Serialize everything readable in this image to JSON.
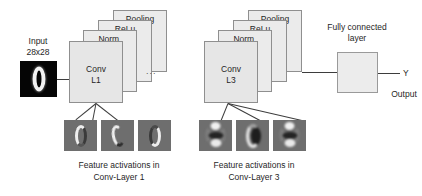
{
  "figure": {
    "type": "cnn-architecture-diagram",
    "title": "",
    "background_color": "#ffffff",
    "plate_fill": "#ebebeb",
    "plate_stroke": "#8f8f8f",
    "line_color": "#3d3d3d",
    "thumb_background": "#6e6e6e",
    "input_background": "#050505"
  },
  "input": {
    "label_line1": "Input",
    "label_line2": "28x28",
    "thumbnail_alt": "handwritten-digit-zero"
  },
  "blocks": [
    {
      "id": "conv-l1",
      "plates": [
        {
          "name": "pooling",
          "label": "Pooling"
        },
        {
          "name": "relu",
          "label": "ReLu"
        },
        {
          "name": "norm",
          "label": "Norm."
        },
        {
          "name": "conv",
          "label_line1": "Conv",
          "label_line2": "L1"
        }
      ]
    },
    {
      "id": "conv-l3",
      "plates": [
        {
          "name": "pooling",
          "label": "Pooling"
        },
        {
          "name": "relu",
          "label": "ReLu"
        },
        {
          "name": "norm",
          "label": "Norm."
        },
        {
          "name": "conv",
          "label_line1": "Conv",
          "label_line2": "L3"
        }
      ]
    }
  ],
  "ellipsis": "...",
  "fully_connected": {
    "label_line1": "Fully connected",
    "label_line2": "layer"
  },
  "output": {
    "symbol": "Y",
    "label": "Output"
  },
  "activations": [
    {
      "id": "conv-layer-1",
      "caption_line1": "Feature activations in",
      "caption_line2": "Conv-Layer 1",
      "maps": [
        "activation-map-1",
        "activation-map-2",
        "activation-map-3"
      ]
    },
    {
      "id": "conv-layer-3",
      "caption_line1": "Feature activations in",
      "caption_line2": "Conv-Layer 3",
      "maps": [
        "activation-map-1",
        "activation-map-2",
        "activation-map-3"
      ]
    }
  ]
}
